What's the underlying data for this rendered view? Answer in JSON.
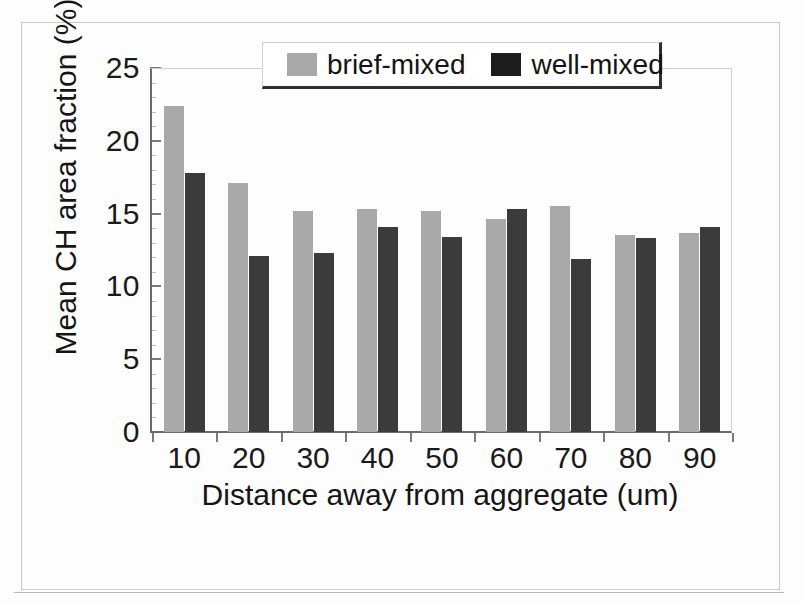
{
  "chart_data": {
    "type": "bar",
    "title": "",
    "subtitle": "",
    "xlabel": "Distance away from aggregate (um)",
    "ylabel": "Mean CH area fraction (%)",
    "categories": [
      "10",
      "20",
      "30",
      "40",
      "50",
      "60",
      "70",
      "80",
      "90"
    ],
    "series": [
      {
        "name": "brief-mixed",
        "color": "#a9a9a9",
        "values": [
          22.4,
          17.1,
          15.2,
          15.3,
          15.2,
          14.6,
          15.5,
          13.5,
          13.7
        ]
      },
      {
        "name": "well-mixed",
        "color": "#3b3b3b",
        "values": [
          17.8,
          12.1,
          12.3,
          14.1,
          13.4,
          15.3,
          11.9,
          13.3,
          14.1
        ]
      }
    ],
    "ylim": [
      0,
      25
    ],
    "yticks": [
      0,
      5,
      10,
      15,
      20,
      25
    ],
    "ytick_labels": [
      "0",
      "5",
      "10",
      "15",
      "20",
      "25"
    ],
    "xtick_labels": [
      "10",
      "20",
      "30",
      "40",
      "50",
      "60",
      "70",
      "80",
      "90"
    ],
    "grid": false,
    "legend_position": "top-center",
    "legend_entries": [
      "brief-mixed",
      "well-mixed"
    ]
  },
  "legend": {
    "items": [
      {
        "label": "brief-mixed",
        "swatch": "light-gray-swatch-icon"
      },
      {
        "label": "well-mixed",
        "swatch": "black-swatch-icon"
      }
    ]
  },
  "axes": {
    "y_title": "Mean CH area fraction (%)",
    "x_title": "Distance away from aggregate (um)"
  }
}
